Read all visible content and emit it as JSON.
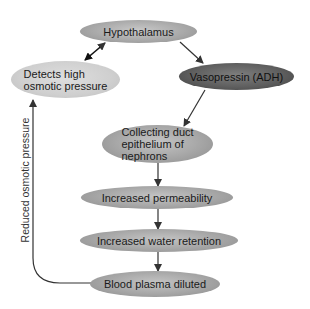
{
  "diagram": {
    "nodes": {
      "hypothalamus": "Hypothalamus",
      "detects_line1": "Detects high",
      "detects_line2": "osmotic pressure",
      "vasopressin": "Vasopressin (ADH)",
      "collecting_line1": "Collecting duct",
      "collecting_line2": "epithelium of",
      "collecting_line3": "nephrons",
      "permeability": "Increased permeability",
      "water_retention": "Increased water retention",
      "blood_plasma": "Blood plasma diluted"
    },
    "feedback_label": "Reduced osmotic pressure",
    "edges": [
      {
        "from": "Detects high osmotic pressure",
        "to": "Hypothalamus",
        "type": "bidirectional"
      },
      {
        "from": "Hypothalamus",
        "to": "Vasopressin (ADH)",
        "type": "arrow"
      },
      {
        "from": "Vasopressin (ADH)",
        "to": "Collecting duct epithelium of nephrons",
        "type": "arrow"
      },
      {
        "from": "Collecting duct epithelium of nephrons",
        "to": "Increased permeability",
        "type": "arrow"
      },
      {
        "from": "Increased permeability",
        "to": "Increased water retention",
        "type": "arrow"
      },
      {
        "from": "Increased water retention",
        "to": "Blood plasma diluted",
        "type": "arrow"
      },
      {
        "from": "Blood plasma diluted",
        "to": "Detects high osmotic pressure",
        "type": "arrow",
        "label": "Reduced osmotic pressure"
      }
    ],
    "colors": {
      "node_fill": "#a6a6a6",
      "detect_fill": "#cfcfcf",
      "vasopressin_fill": "#5f5f5f",
      "arrow": "#333333"
    }
  }
}
